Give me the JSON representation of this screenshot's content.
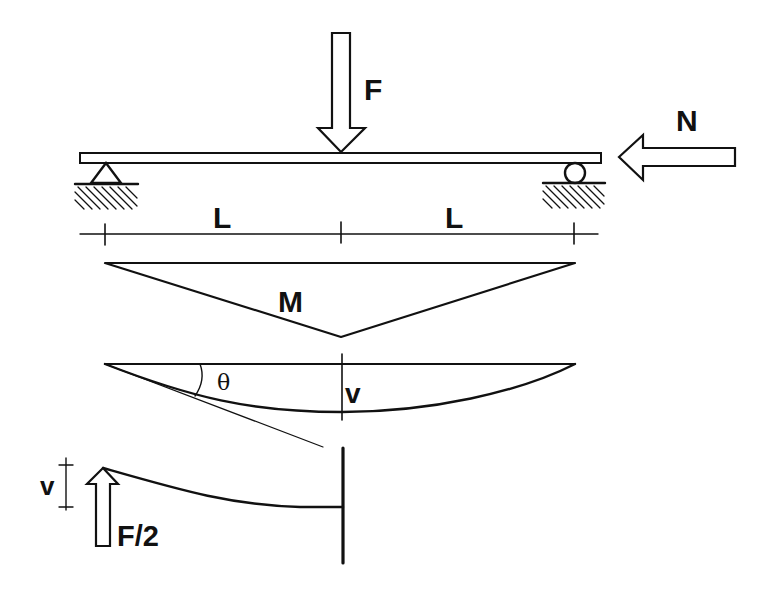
{
  "labels": {
    "load_F": "F",
    "axial_N": "N",
    "span_left": "L",
    "span_right": "L",
    "moment": "M",
    "rotation": "θ",
    "deflection_mid": "v",
    "deflection_cantilever": "v",
    "half_load": "F/2"
  },
  "colors": {
    "ink": "#111111",
    "background": "#ffffff"
  },
  "parts": [
    "simply-supported beam with central point load F and axial compression N",
    "pin support (left), roller support (right)",
    "dimension line: two spans L",
    "triangular bending moment diagram M",
    "deflected shape with slope θ and midspan deflection v",
    "equivalent half-cantilever with tip load F/2 and tip deflection v"
  ]
}
